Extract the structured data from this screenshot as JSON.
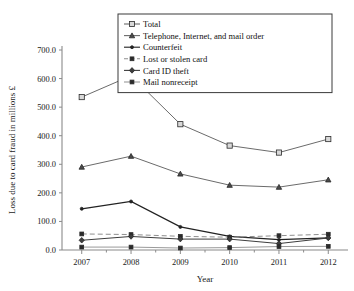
{
  "chart_data": {
    "type": "line",
    "title": "",
    "xlabel": "Year",
    "ylabel": "Loss due to card fraud in millions £",
    "categories": [
      "2007",
      "2008",
      "2009",
      "2010",
      "2011",
      "2012"
    ],
    "x": [
      2007,
      2008,
      2009,
      2010,
      2011,
      2012
    ],
    "xlim": [
      2006.6,
      2012.4
    ],
    "ylim": [
      0,
      700
    ],
    "yticks": [
      0.0,
      100.0,
      200.0,
      300.0,
      400.0,
      500.0,
      600.0,
      700.0
    ],
    "ytick_labels": [
      "0.0",
      "100.0",
      "200.0",
      "300.0",
      "400.0",
      "500.0",
      "600.0",
      "700.0"
    ],
    "grid": false,
    "legend_position": "upper center",
    "series": [
      {
        "name": "Total",
        "values": [
          535.2,
          609.9,
          440.3,
          365.4,
          341.0,
          388.3
        ],
        "marker": "square-filled",
        "color": "#6b6b6b",
        "linestyle": "solid"
      },
      {
        "name": "Telephone, Internet, and mail order",
        "values": [
          290.5,
          328.4,
          266.4,
          226.9,
          220.1,
          245.8
        ],
        "marker": "triangle-filled",
        "color": "#6b6b6b",
        "linestyle": "solid"
      },
      {
        "name": "Counterfeit",
        "values": [
          144.3,
          169.8,
          80.9,
          47.6,
          36.1,
          42.1
        ],
        "marker": "dot",
        "color": "#222222",
        "linestyle": "solid"
      },
      {
        "name": "Lost or stolen card",
        "values": [
          56.2,
          54.1,
          47.9,
          44.8,
          50.1,
          55.2
        ],
        "marker": "square-small",
        "color": "#8f8f8f",
        "linestyle": "dashed"
      },
      {
        "name": "Card ID theft",
        "values": [
          34.1,
          47.4,
          38.2,
          38.1,
          22.5,
          42.1
        ],
        "marker": "diamond",
        "color": "#3d3d3d",
        "linestyle": "solid"
      },
      {
        "name": "Mail nonreceipt",
        "values": [
          10.2,
          10.2,
          6.9,
          8.4,
          12.1,
          12.8
        ],
        "marker": "square-small",
        "color": "#9a9a9a",
        "linestyle": "solid"
      }
    ]
  },
  "colors": {
    "axis": "#8a8a8a",
    "text": "#1a1a1a",
    "legend_border": "#3a3a3a",
    "background": "#ffffff"
  }
}
